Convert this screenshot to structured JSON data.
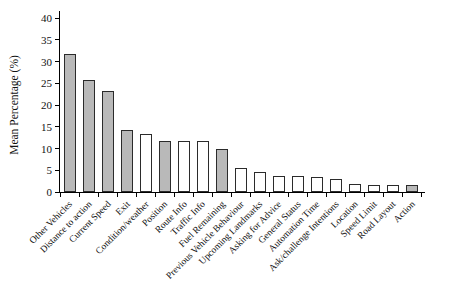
{
  "chart_data": {
    "type": "bar",
    "title": "",
    "xlabel": "",
    "ylabel": "Mean Percentage (%)",
    "ylim": [
      0,
      40
    ],
    "yticks": [
      0,
      5,
      10,
      15,
      20,
      25,
      30,
      35,
      40
    ],
    "grid": false,
    "legend": "none",
    "categories": [
      "Other Vehicles",
      "Distance to action",
      "Current Speed",
      "Exit",
      "Condition/weather",
      "Position",
      "Route Info",
      "Traffic Info",
      "Fuel Remaining",
      "Previous Vehicle Behaviour",
      "Upcoming Landmarks",
      "Asking for Advice",
      "General Status",
      "Automation Time",
      "Ask/challenge Intentions",
      "Location",
      "Speed Limit",
      "Road Layout",
      "Action"
    ],
    "values": [
      31.7,
      25.8,
      23.3,
      14.2,
      13.3,
      11.7,
      11.7,
      11.7,
      10.0,
      5.5,
      4.5,
      3.6,
      3.6,
      3.5,
      3.0,
      1.9,
      1.5,
      1.5,
      1.7
    ],
    "bar_fills": [
      "gray",
      "gray",
      "gray",
      "gray",
      "white",
      "gray",
      "white",
      "white",
      "gray",
      "white",
      "white",
      "white",
      "white",
      "white",
      "white",
      "white",
      "white",
      "white",
      "gray"
    ],
    "colors": {
      "gray_fill": "#b9b9b9",
      "white_fill": "#ffffff",
      "bar_edge": "#2b2b2b",
      "axis": "#000000",
      "text": "#111111",
      "background": "#ffffff"
    }
  }
}
